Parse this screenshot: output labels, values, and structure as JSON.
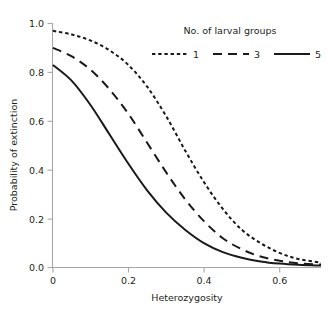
{
  "chart_data": {
    "type": "line",
    "title": "",
    "xlabel": "Heterozygosity",
    "ylabel": "Probability of extinction",
    "xlim": [
      0,
      0.71
    ],
    "ylim": [
      0,
      1.0
    ],
    "grid": false,
    "legend_position": "top-right",
    "legend_title": "No. of larval groups",
    "x_ticks": [
      "0",
      "0.2",
      "0.4",
      "0.6"
    ],
    "x_tick_values": [
      0,
      0.2,
      0.4,
      0.6
    ],
    "y_ticks": [
      "0.0",
      "0.2",
      "0.4",
      "0.6",
      "0.8",
      "1.0"
    ],
    "y_tick_values": [
      0.0,
      0.2,
      0.4,
      0.6,
      0.8,
      1.0
    ],
    "x": [
      0.0,
      0.05,
      0.1,
      0.15,
      0.2,
      0.25,
      0.3,
      0.35,
      0.4,
      0.45,
      0.5,
      0.55,
      0.6,
      0.65,
      0.71
    ],
    "series": [
      {
        "name": "1",
        "style": "dotted",
        "values": [
          0.97,
          0.955,
          0.93,
          0.89,
          0.83,
          0.74,
          0.62,
          0.48,
          0.35,
          0.24,
          0.155,
          0.1,
          0.06,
          0.035,
          0.02
        ]
      },
      {
        "name": "3",
        "style": "dashed",
        "values": [
          0.9,
          0.865,
          0.81,
          0.73,
          0.63,
          0.51,
          0.39,
          0.28,
          0.19,
          0.12,
          0.075,
          0.045,
          0.028,
          0.017,
          0.012
        ]
      },
      {
        "name": "5",
        "style": "solid",
        "values": [
          0.83,
          0.765,
          0.665,
          0.545,
          0.425,
          0.315,
          0.225,
          0.155,
          0.1,
          0.063,
          0.04,
          0.025,
          0.016,
          0.011,
          0.008
        ]
      }
    ]
  },
  "axes": {
    "x_title": "Heterozygosity",
    "y_title": "Probability of extinction",
    "x_tick_labels": [
      "0",
      "0.2",
      "0.4",
      "0.6"
    ],
    "y_tick_labels": [
      "0.0",
      "0.2",
      "0.4",
      "0.6",
      "0.8",
      "1.0"
    ]
  },
  "legend": {
    "title": "No. of larval groups",
    "items": [
      {
        "label": "1",
        "style": "dotted"
      },
      {
        "label": "3",
        "style": "dashed"
      },
      {
        "label": "5",
        "style": "solid"
      }
    ]
  },
  "colors": {
    "line": "#1a1a1a",
    "axis": "#a7a7a7",
    "text": "#231f20",
    "background": "#ffffff"
  }
}
